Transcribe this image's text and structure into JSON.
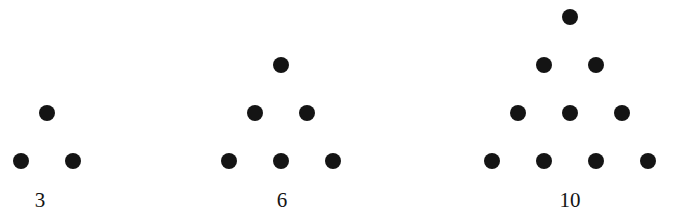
{
  "figure": {
    "background_color": "#ffffff",
    "dot_color": "#141414",
    "label_color": "#141414",
    "dot_diameter": 16
  },
  "chart_data": {
    "type": "scatter",
    "title": "",
    "subtitle": "",
    "xlabel": "",
    "ylabel": "",
    "grid": false,
    "legend": "none",
    "xlim": [
      0,
      680
    ],
    "ylim": [
      0,
      224
    ],
    "categories": [
      "3",
      "6",
      "10"
    ],
    "values": [
      3,
      6,
      10
    ],
    "series": [
      {
        "name": "3",
        "label": "3",
        "label_x": 40,
        "label_y": 206,
        "rows": 2,
        "dot_count": 3,
        "points": [
          {
            "x": 47,
            "y": 113
          },
          {
            "x": 21,
            "y": 161
          },
          {
            "x": 73,
            "y": 161
          }
        ]
      },
      {
        "name": "6",
        "label": "6",
        "label_x": 282,
        "label_y": 206,
        "rows": 3,
        "dot_count": 6,
        "points": [
          {
            "x": 281,
            "y": 65
          },
          {
            "x": 255,
            "y": 113
          },
          {
            "x": 307,
            "y": 113
          },
          {
            "x": 229,
            "y": 161
          },
          {
            "x": 281,
            "y": 161
          },
          {
            "x": 333,
            "y": 161
          }
        ]
      },
      {
        "name": "10",
        "label": "10",
        "label_x": 570,
        "label_y": 206,
        "rows": 4,
        "dot_count": 10,
        "points": [
          {
            "x": 570,
            "y": 17
          },
          {
            "x": 544,
            "y": 65
          },
          {
            "x": 596,
            "y": 65
          },
          {
            "x": 518,
            "y": 113
          },
          {
            "x": 570,
            "y": 113
          },
          {
            "x": 622,
            "y": 113
          },
          {
            "x": 492,
            "y": 161
          },
          {
            "x": 544,
            "y": 161
          },
          {
            "x": 596,
            "y": 161
          },
          {
            "x": 648,
            "y": 161
          }
        ]
      }
    ]
  }
}
